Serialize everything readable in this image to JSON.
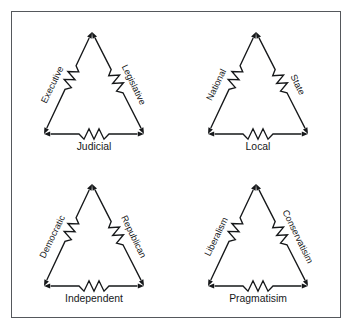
{
  "figure": {
    "title": "",
    "background_color": "#ffffff",
    "border_color": "#55585c",
    "line_color": "#16181a"
  },
  "chart_data": {
    "type": "diagram",
    "title": "",
    "subtitle": "",
    "xlabel": "",
    "ylabel": "",
    "layout": "2x2 grid of triangular triad diagrams",
    "node_count_per_triad": 3,
    "edge_style": "double-headed arrow with series resistor symbol",
    "triads": [
      {
        "id": "separation-of-powers",
        "position": "top-left",
        "left_label": "Executive",
        "right_label": "Legislative",
        "bottom_label": "Judicial"
      },
      {
        "id": "federalism",
        "position": "top-right",
        "left_label": "National",
        "right_label": "State",
        "bottom_label": "Local"
      },
      {
        "id": "political-parties",
        "position": "bottom-left",
        "left_label": "Democratic",
        "right_label": "Republican",
        "bottom_label": "Independent"
      },
      {
        "id": "ideologies",
        "position": "bottom-right",
        "left_label": "Liberalism",
        "right_label": "Conservatisim",
        "bottom_label": "Pragmatisim"
      }
    ]
  }
}
